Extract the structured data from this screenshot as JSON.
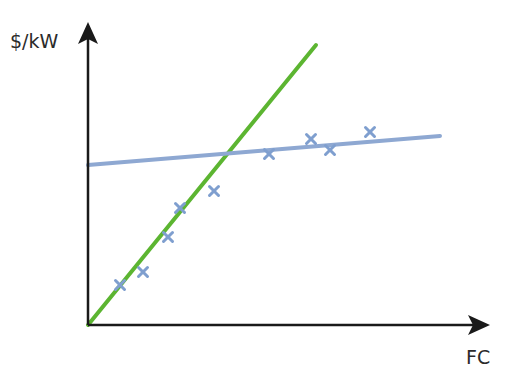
{
  "chart_data": {
    "type": "scatter",
    "title": "",
    "xlabel": "FC",
    "ylabel": "$/kW",
    "grid": false,
    "legend": "none",
    "axis_ticks": "none",
    "series": [
      {
        "name": "data-points",
        "kind": "scatter",
        "marker": "x",
        "color": "#7f9fcf",
        "points_px": [
          [
            120,
            285
          ],
          [
            143,
            272
          ],
          [
            168,
            237
          ],
          [
            180,
            208
          ],
          [
            214,
            191
          ],
          [
            269,
            154
          ],
          [
            311,
            139
          ],
          [
            330,
            150
          ],
          [
            370,
            132
          ]
        ]
      },
      {
        "name": "steep-line",
        "kind": "line",
        "color": "#5cb531",
        "points_px": [
          [
            88,
            325
          ],
          [
            316,
            45
          ]
        ]
      },
      {
        "name": "flat-line",
        "kind": "line",
        "color": "#8ea8d2",
        "points_px": [
          [
            88,
            165
          ],
          [
            440,
            136
          ]
        ]
      }
    ],
    "axes": {
      "origin_px": [
        88,
        325
      ],
      "x_end_px": 490,
      "y_end_px": 22,
      "color": "#1a1a1a"
    }
  },
  "labels": {
    "y": "$/kW",
    "x": "FC"
  }
}
